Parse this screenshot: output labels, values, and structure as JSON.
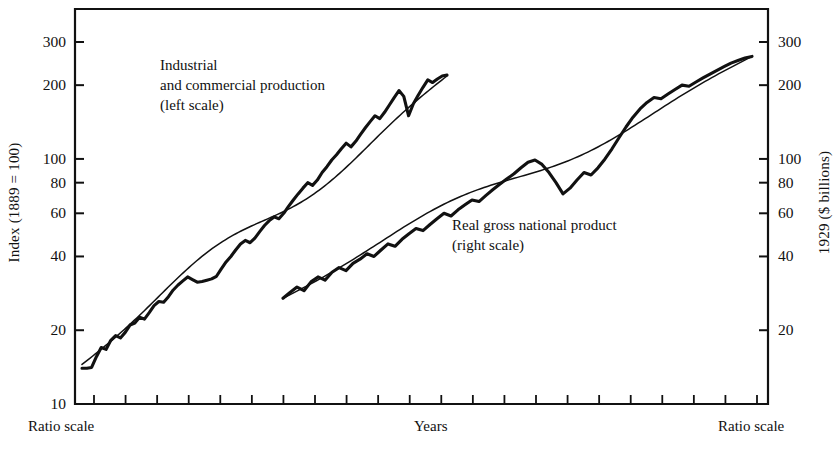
{
  "figure": {
    "background_color": "#ffffff",
    "ink_color": "#111111"
  },
  "axes": {
    "left_title": "Index (1889 = 100)",
    "right_title": "1929 ($ billions)",
    "bottom_center_label": "Years",
    "bottom_left_label": "Ratio scale",
    "bottom_right_label": "Ratio scale"
  },
  "annotations": {
    "series_1": "Industrial\nand commercial production\n(left scale)",
    "series_2": "Real gross national product\n(right scale)"
  },
  "chart_data": {
    "type": "line",
    "title": "",
    "subtitle": "",
    "xlabel": "Years",
    "ylabel": "Index (1889 = 100)",
    "y2label": "1929 ($ billions)",
    "scale": "log",
    "scale_note": "Ratio scale",
    "grid": false,
    "legend": "inline annotations",
    "ylim": [
      10,
      380
    ],
    "y2lim": [
      10,
      380
    ],
    "yticks": [
      10,
      20,
      40,
      60,
      80,
      100,
      200,
      300
    ],
    "ytick_labels": [
      "10",
      "20",
      "40",
      "60",
      "80",
      "100",
      "200",
      "300"
    ],
    "y2ticks": [
      20,
      40,
      60,
      80,
      100,
      200,
      300
    ],
    "y2tick_labels": [
      "20",
      "40",
      "60",
      "80",
      "100",
      "200",
      "300"
    ],
    "xticks_count": 22,
    "xtick_labels": [],
    "series": [
      {
        "name": "Industrial and commercial production (left scale)",
        "scale_side": "left",
        "x_start_px": 82,
        "x_end_px": 447,
        "values": [
          14.0,
          14.0,
          14.1,
          15.6,
          17.0,
          16.7,
          18.2,
          19.0,
          18.6,
          19.6,
          21.0,
          21.4,
          22.6,
          22.2,
          23.6,
          25.2,
          26.2,
          26.0,
          27.4,
          29.2,
          30.6,
          31.8,
          33.0,
          32.2,
          31.4,
          31.6,
          32.0,
          32.4,
          33.2,
          35.6,
          38.0,
          40.0,
          42.5,
          45.0,
          46.5,
          45.5,
          47.5,
          50.5,
          53.5,
          56.0,
          58.0,
          57.0,
          60.0,
          64.0,
          68.0,
          72.0,
          76.0,
          80.0,
          78.0,
          82.0,
          88.0,
          93.0,
          99.0,
          104.0,
          110.0,
          116.0,
          112.0,
          118.0,
          126.0,
          134.0,
          142.0,
          150.0,
          146.0,
          155.0,
          166.0,
          178.0,
          190.0,
          180.0,
          150.0,
          168.0,
          182.0,
          196.0,
          210.0,
          205.0,
          212.0,
          218.0,
          220.0
        ]
      },
      {
        "name": "Real gross national product (right scale)",
        "scale_side": "right",
        "x_start_px": 283,
        "x_end_px": 752,
        "values": [
          27.0,
          28.5,
          30.0,
          29.0,
          31.5,
          33.0,
          32.0,
          34.5,
          36.0,
          35.0,
          37.5,
          39.0,
          41.0,
          40.0,
          42.5,
          45.0,
          44.0,
          47.0,
          49.5,
          52.0,
          51.0,
          54.0,
          57.0,
          60.0,
          58.5,
          62.0,
          65.0,
          68.0,
          67.0,
          71.0,
          75.0,
          79.0,
          83.0,
          87.0,
          92.0,
          97.0,
          99.0,
          95.0,
          88.0,
          80.0,
          72.0,
          76.0,
          82.0,
          88.0,
          86.0,
          92.0,
          100.0,
          110.0,
          122.0,
          135.0,
          148.0,
          160.0,
          170.0,
          178.0,
          176.0,
          184.0,
          192.0,
          200.0,
          198.0,
          206.0,
          214.0,
          222.0,
          230.0,
          238.0,
          246.0,
          252.0,
          258.0,
          262.0
        ]
      }
    ],
    "trend_lines": [
      {
        "for_series": "Industrial and commercial production (left scale)",
        "description": "smooth fitted trend overlaying the data curve",
        "start_value": 14.5,
        "end_value": 218.0
      },
      {
        "for_series": "Real gross national product (right scale)",
        "description": "smooth fitted trend overlaying the data curve",
        "start_value": 27.0,
        "end_value": 262.0
      }
    ]
  }
}
